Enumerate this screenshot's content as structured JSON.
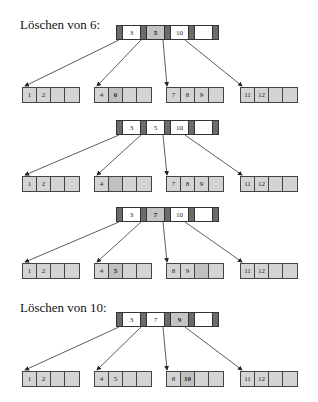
{
  "headings": [
    "Löschen von 6:",
    "Löschen von 10:"
  ],
  "colors": {
    "leaf_fill": "#d4d4d4",
    "pointer_fill": "#6b6b6b",
    "highlight": "#c4c4c4",
    "border": "#333333"
  },
  "trees": [
    {
      "root": {
        "keys": [
          "3",
          "5",
          "10",
          ""
        ],
        "highlight": [
          1
        ]
      },
      "leaves": [
        {
          "keys": [
            "1",
            "2",
            "",
            ""
          ],
          "highlight": []
        },
        {
          "keys": [
            "4",
            "6",
            "",
            ""
          ],
          "highlight": [
            1
          ]
        },
        {
          "keys": [
            "7",
            "8",
            "9",
            ""
          ],
          "highlight": []
        },
        {
          "keys": [
            "11",
            "12",
            "",
            ""
          ],
          "highlight": []
        }
      ]
    },
    {
      "root": {
        "keys": [
          "3",
          "5",
          "10",
          ""
        ],
        "highlight": []
      },
      "leaves": [
        {
          "keys": [
            "1",
            "2",
            "",
            ""
          ],
          "highlight": []
        },
        {
          "keys": [
            "4",
            "",
            "",
            ""
          ],
          "highlight": [
            1
          ]
        },
        {
          "keys": [
            "7",
            "8",
            "9",
            ""
          ],
          "highlight": []
        },
        {
          "keys": [
            "11",
            "12",
            "",
            ""
          ],
          "highlight": []
        }
      ]
    },
    {
      "root": {
        "keys": [
          "3",
          "7",
          "10",
          ""
        ],
        "highlight": [
          1
        ]
      },
      "leaves": [
        {
          "keys": [
            "1",
            "2",
            "",
            ""
          ],
          "highlight": []
        },
        {
          "keys": [
            "4",
            "5",
            "",
            ""
          ],
          "highlight": [
            1
          ]
        },
        {
          "keys": [
            "8",
            "9",
            "",
            ""
          ],
          "highlight": [
            2
          ]
        },
        {
          "keys": [
            "11",
            "12",
            "",
            ""
          ],
          "highlight": []
        }
      ]
    },
    {
      "root": {
        "keys": [
          "3",
          "7",
          "9",
          ""
        ],
        "highlight": [
          2
        ]
      },
      "leaves": [
        {
          "keys": [
            "1",
            "2",
            "",
            ""
          ],
          "highlight": []
        },
        {
          "keys": [
            "4",
            "5",
            "",
            ""
          ],
          "highlight": []
        },
        {
          "keys": [
            "8",
            "10",
            "",
            ""
          ],
          "highlight": [
            1
          ]
        },
        {
          "keys": [
            "11",
            "12",
            "",
            ""
          ],
          "highlight": []
        }
      ]
    }
  ]
}
